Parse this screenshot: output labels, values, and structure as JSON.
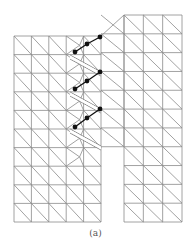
{
  "figure": {
    "caption": "(a)",
    "colors": {
      "mesh": "#8a8a8a",
      "nodes": "#111111",
      "background": "#ffffff"
    }
  },
  "mesh": {
    "left_block": {
      "x0": 14,
      "x1": 101,
      "y0": 36,
      "y1": 222,
      "cols": 5,
      "rows": 10
    },
    "right_block": {
      "x0": 124,
      "x1": 182,
      "y0": 15,
      "y1": 222,
      "cols": 3,
      "rows": 11
    },
    "cracks": [
      {
        "from": [
          70,
          55
        ],
        "to": [
          101,
          72
        ]
      },
      {
        "from": [
          70,
          92
        ],
        "to": [
          101,
          109
        ]
      },
      {
        "from": [
          70,
          129
        ],
        "to": [
          101,
          146
        ]
      }
    ],
    "enriched_node_chains": [
      [
        [
          75,
          52
        ],
        [
          87,
          44
        ],
        [
          100,
          37
        ]
      ],
      [
        [
          75,
          89
        ],
        [
          87,
          81
        ],
        [
          100,
          72
        ]
      ],
      [
        [
          75,
          127
        ],
        [
          87,
          118
        ],
        [
          100,
          109
        ]
      ]
    ]
  }
}
